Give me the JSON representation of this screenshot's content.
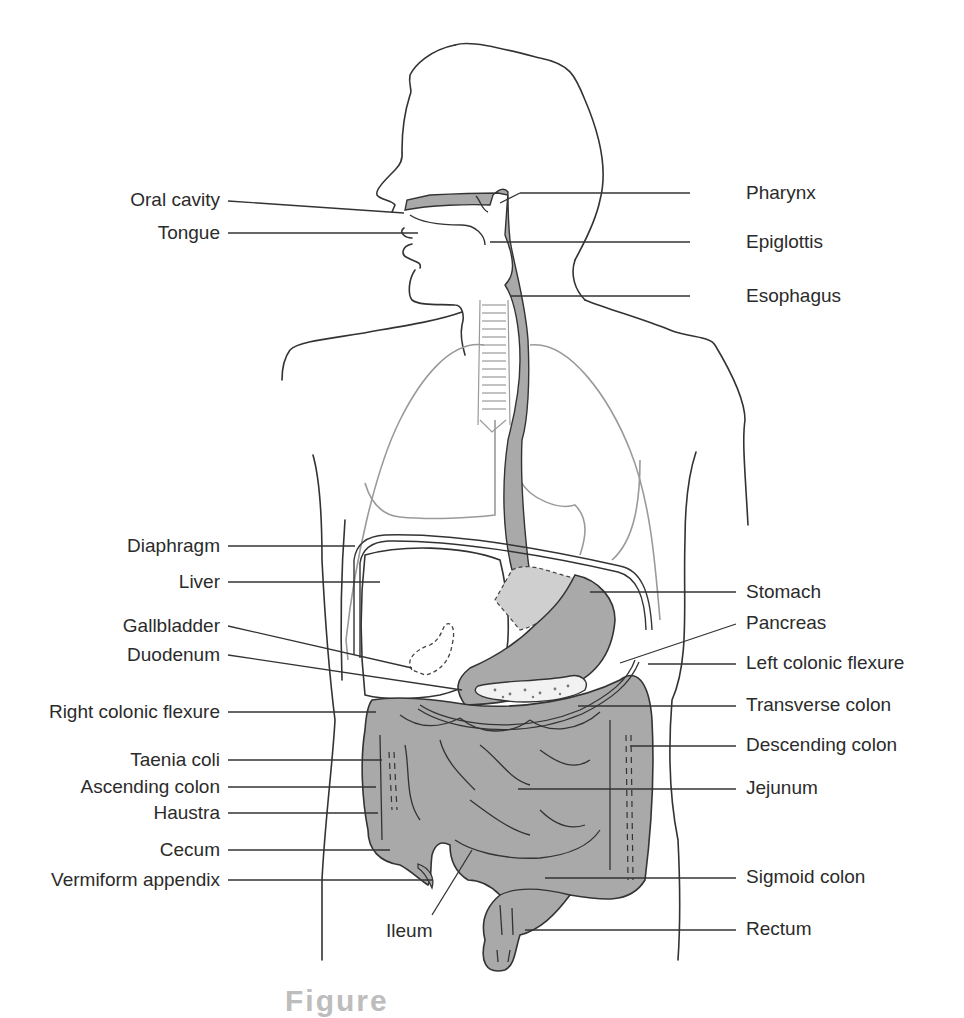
{
  "diagram": {
    "type": "anatomical-illustration",
    "colors": {
      "outline": "#333333",
      "organ_fill": "#a9a9a9",
      "organ_fill_light": "#cfcfcf",
      "lung_outline": "#9a9a9a",
      "background": "#ffffff"
    },
    "labels_left": [
      {
        "id": "oral-cavity",
        "text": "Oral cavity"
      },
      {
        "id": "tongue",
        "text": "Tongue"
      },
      {
        "id": "diaphragm",
        "text": "Diaphragm"
      },
      {
        "id": "liver",
        "text": "Liver"
      },
      {
        "id": "gallbladder",
        "text": "Gallbladder"
      },
      {
        "id": "duodenum",
        "text": "Duodenum"
      },
      {
        "id": "right-colonic-flexure",
        "text": "Right colonic flexure"
      },
      {
        "id": "taenia-coli",
        "text": "Taenia coli"
      },
      {
        "id": "ascending-colon",
        "text": "Ascending colon"
      },
      {
        "id": "haustra",
        "text": "Haustra"
      },
      {
        "id": "cecum",
        "text": "Cecum"
      },
      {
        "id": "vermiform-appendix",
        "text": "Vermiform appendix"
      }
    ],
    "labels_right": [
      {
        "id": "pharynx",
        "text": "Pharynx"
      },
      {
        "id": "epiglottis",
        "text": "Epiglottis"
      },
      {
        "id": "esophagus",
        "text": "Esophagus"
      },
      {
        "id": "stomach",
        "text": "Stomach"
      },
      {
        "id": "pancreas",
        "text": "Pancreas"
      },
      {
        "id": "left-colonic-flexure",
        "text": "Left colonic flexure"
      },
      {
        "id": "transverse-colon",
        "text": "Transverse colon"
      },
      {
        "id": "descending-colon",
        "text": "Descending colon"
      },
      {
        "id": "jejunum",
        "text": "Jejunum"
      },
      {
        "id": "sigmoid-colon",
        "text": "Sigmoid colon"
      },
      {
        "id": "rectum",
        "text": "Rectum"
      }
    ],
    "labels_bottom": [
      {
        "id": "ileum",
        "text": "Ileum"
      }
    ],
    "caption": "Figure"
  }
}
